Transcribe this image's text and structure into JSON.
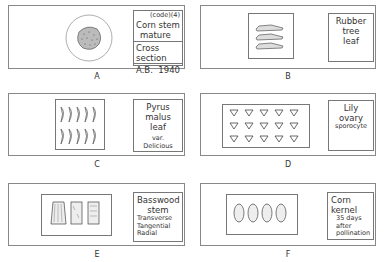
{
  "figure": {
    "slides": [
      {
        "id": "A",
        "caption": "A",
        "label": {
          "code": "(code)(4)",
          "title": "Corn stem mature",
          "line1": "Corn stem",
          "line2": "mature",
          "subtitle": "Cross section",
          "author": "A.B.",
          "year": "1940"
        },
        "specimen": "circular cross-section under round coverslip"
      },
      {
        "id": "B",
        "caption": "B",
        "label": {
          "line1": "Rubber tree",
          "line2": "leaf"
        },
        "specimen": "3 leaf strips"
      },
      {
        "id": "C",
        "caption": "C",
        "label": {
          "line1": "Pyrus malus",
          "line2": "leaf",
          "line3": "var. Delicious"
        },
        "specimen": "2 rows x 5 leaf sections"
      },
      {
        "id": "D",
        "caption": "D",
        "label": {
          "line1": "Lily ovary",
          "line2": "sporocyte"
        },
        "specimen": "3 rows x 5 triangular sections"
      },
      {
        "id": "E",
        "caption": "E",
        "label": {
          "line1": "Basswood",
          "line2": "stem",
          "line3": "Transverse",
          "line4": "Tangential",
          "line5": "Radial"
        },
        "specimen": "3 wood sections"
      },
      {
        "id": "F",
        "caption": "F",
        "label": {
          "line1": "Corn kernel",
          "line2": "35 days",
          "line3": "after",
          "line4": "pollination"
        },
        "specimen": "4 kernel sections"
      }
    ]
  }
}
